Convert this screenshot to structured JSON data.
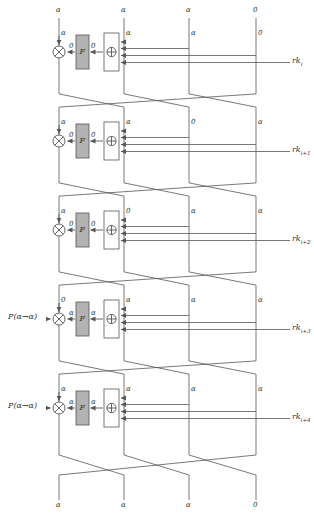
{
  "diagram": {
    "type": "feistel-differential-trail",
    "branch_count": 4,
    "branch_x": [
      59,
      124,
      189,
      256
    ],
    "round_count": 5,
    "function_box_label": "F",
    "xor_glyph": "⊕",
    "alpha": "α",
    "zero": "0",
    "top_labels": [
      "α",
      "α",
      "α",
      "0"
    ],
    "bottom_labels": [
      "α",
      "α",
      "α",
      "0"
    ],
    "rounds": [
      {
        "index": 0,
        "key_label": "rk",
        "key_sub": "i",
        "branch_labels": [
          "α",
          "α",
          "α",
          "0"
        ],
        "label_after_xor": "0",
        "label_before_f": "0",
        "left_annotation": "",
        "y": 28
      },
      {
        "index": 1,
        "key_label": "rk",
        "key_sub": "i+1",
        "branch_labels": [
          "α",
          "α",
          "0",
          "α"
        ],
        "label_after_xor": "0",
        "label_before_f": "0",
        "left_annotation": "",
        "y": 117
      },
      {
        "index": 2,
        "key_label": "rk",
        "key_sub": "i+2",
        "branch_labels": [
          "α",
          "0",
          "α",
          "α"
        ],
        "label_after_xor": "0",
        "label_before_f": "0",
        "left_annotation": "",
        "y": 206
      },
      {
        "index": 3,
        "key_label": "rk",
        "key_sub": "i+3",
        "branch_labels": [
          "0",
          "α",
          "α",
          "α"
        ],
        "label_after_xor": "α",
        "label_before_f": "α",
        "left_annotation": "P(α→α)",
        "y": 295
      },
      {
        "index": 4,
        "key_label": "rk",
        "key_sub": "i+4",
        "branch_labels": [
          "α",
          "α",
          "α",
          "α"
        ],
        "label_after_xor": "α",
        "label_before_f": "α",
        "left_annotation": "P(α→α)",
        "y": 384
      }
    ],
    "colors": {
      "line": "#555555",
      "text": "#333333",
      "f_box_fill": "#b3b3b3",
      "f_box_stroke": "#555555",
      "xor_box_fill": "#ffffff",
      "background": "#ffffff"
    }
  }
}
